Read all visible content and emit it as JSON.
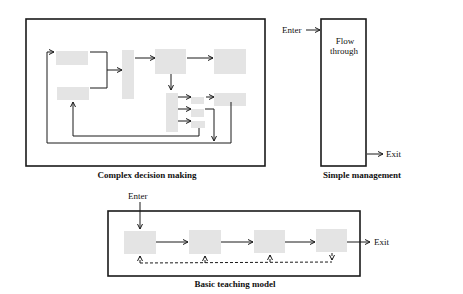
{
  "diagrams": {
    "complex": {
      "caption": "Complex decision making"
    },
    "simple": {
      "caption": "Simple management",
      "enter_label": "Enter",
      "exit_label": "Exit",
      "body_line1": "Flow",
      "body_line2": "through"
    },
    "basic": {
      "caption": "Basic teaching model",
      "enter_label": "Enter",
      "exit_label": "Exit"
    }
  },
  "colors": {
    "box_fill": "#e4e4e4",
    "line": "#1a1a1a"
  }
}
